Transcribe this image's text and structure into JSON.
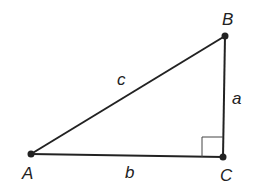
{
  "diagram": {
    "type": "right-triangle",
    "colors": {
      "stroke": "#222222",
      "background": "#ffffff"
    },
    "vertices": [
      {
        "id": "A",
        "label": "A",
        "x": 31,
        "y": 154,
        "label_x": 22,
        "label_y": 179
      },
      {
        "id": "B",
        "label": "B",
        "x": 225,
        "y": 36,
        "label_x": 222,
        "label_y": 25
      },
      {
        "id": "C",
        "label": "C",
        "x": 223,
        "y": 157,
        "label_x": 220,
        "label_y": 181
      }
    ],
    "sides": [
      {
        "id": "c",
        "label": "c",
        "from": "A",
        "to": "B",
        "label_x": 117,
        "label_y": 85
      },
      {
        "id": "b",
        "label": "b",
        "from": "A",
        "to": "C",
        "label_x": 125,
        "label_y": 178
      },
      {
        "id": "a",
        "label": "a",
        "from": "B",
        "to": "C",
        "label_x": 232,
        "label_y": 104
      }
    ],
    "right_angle_at": "C"
  }
}
